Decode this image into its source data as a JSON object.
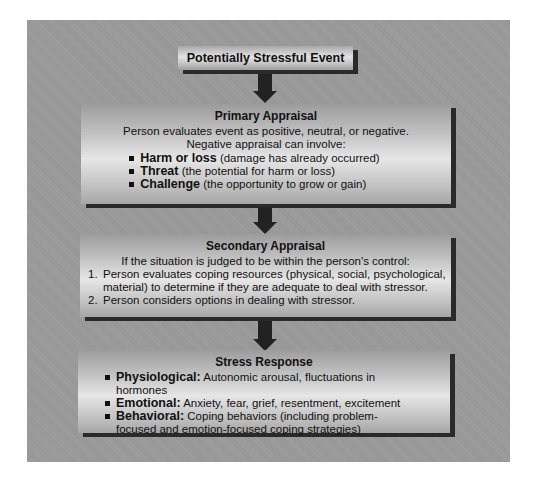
{
  "diagram": {
    "type": "flowchart",
    "nodes": [
      {
        "id": "event",
        "title": "Potentially Stressful Event"
      },
      {
        "id": "primary",
        "title": "Primary Appraisal",
        "lines": [
          "Person evaluates event as positive, neutral, or negative.",
          "Negative appraisal can involve:"
        ],
        "bullets": [
          {
            "term": "Harm or loss",
            "desc": " (damage has already occurred)"
          },
          {
            "term": "Threat",
            "desc": " (the potential for harm or loss)"
          },
          {
            "term": "Challenge",
            "desc": " (the opportunity to grow or gain)"
          }
        ]
      },
      {
        "id": "secondary",
        "title": "Secondary Appraisal",
        "lines": [
          "If the situation is judged to be within the person's control:"
        ],
        "numbered": [
          {
            "num": "1.",
            "text": "Person evaluates coping resources (physical, social, psychological, material) to determine if they are adequate to deal with stressor."
          },
          {
            "num": "2.",
            "text": "Person considers options in dealing with stressor."
          }
        ]
      },
      {
        "id": "stress",
        "title": "Stress Response",
        "bullets": [
          {
            "term": "Physiological:",
            "desc": " Autonomic arousal, fluctuations in hormones"
          },
          {
            "term": "Emotional:",
            "desc": " Anxiety, fear, grief, resentment, excitement"
          },
          {
            "term": "Behavioral:",
            "desc": " Coping behaviors (including problem-focused and emotion-focused coping strategies)"
          }
        ]
      }
    ],
    "edges": [
      {
        "from": "event",
        "to": "primary"
      },
      {
        "from": "primary",
        "to": "secondary"
      },
      {
        "from": "secondary",
        "to": "stress"
      }
    ],
    "colors": {
      "panel": "#9a9a9a",
      "box_light": "#e6e6e6",
      "shadow": "#2a2a2a",
      "arrow": "#222222"
    }
  }
}
